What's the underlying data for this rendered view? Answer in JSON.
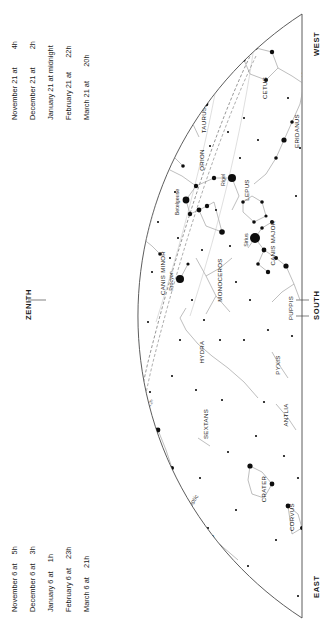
{
  "legend_top": {
    "rows": [
      {
        "date": "November 21 at",
        "time": "4",
        "sup": "h"
      },
      {
        "date": "December 21 at",
        "time": "2",
        "sup": "h"
      },
      {
        "date": "January 21 at midnight",
        "time": "",
        "sup": ""
      },
      {
        "date": "February 21 at",
        "time": "22",
        "sup": "h"
      },
      {
        "date": "March 21 at",
        "time": "20",
        "sup": "h"
      }
    ]
  },
  "legend_bottom": {
    "rows": [
      {
        "date": "November 6 at",
        "time": "5",
        "sup": "h"
      },
      {
        "date": "December 6 at",
        "time": "3",
        "sup": "h"
      },
      {
        "date": "January 6 at",
        "time": "1",
        "sup": "h"
      },
      {
        "date": "February 6 at",
        "time": "23",
        "sup": "h"
      },
      {
        "date": "March 6 at",
        "time": "21",
        "sup": "h"
      }
    ]
  },
  "directions": {
    "west": "WEST",
    "south": "SOUTH",
    "east": "EAST",
    "zenith": "ZENITH"
  },
  "chart_data": {
    "type": "scatter",
    "xlabel": "Right Ascension",
    "ylabel": "Declination",
    "grid": false,
    "legend_position": "left",
    "ecliptic_label": "Ecliptic",
    "constellations": [
      {
        "name": "PERSEUS",
        "x": 131,
        "y": 122
      },
      {
        "name": "TAURUS",
        "x": 206,
        "y": 120
      },
      {
        "name": "CETUS",
        "x": 267,
        "y": 88
      },
      {
        "name": "ERIDANUS",
        "x": 299,
        "y": 131
      },
      {
        "name": "AURIGA",
        "x": 82,
        "y": 189
      },
      {
        "name": "ORION",
        "x": 204,
        "y": 160
      },
      {
        "name": "LEPUS",
        "x": 249,
        "y": 190
      },
      {
        "name": "CANIS MAJOR",
        "x": 275,
        "y": 243
      },
      {
        "name": "GEMINI",
        "x": 104,
        "y": 247
      },
      {
        "name": "CANIS MINOR",
        "x": 165,
        "y": 273
      },
      {
        "name": "MONOCEROS",
        "x": 222,
        "y": 280
      },
      {
        "name": "PUPPIS",
        "x": 293,
        "y": 308
      },
      {
        "name": "LYNX",
        "x": 70,
        "y": 321
      },
      {
        "name": "CANCER",
        "x": 118,
        "y": 355
      },
      {
        "name": "HYDRA",
        "x": 204,
        "y": 352
      },
      {
        "name": "PYXIS",
        "x": 280,
        "y": 365
      },
      {
        "name": "URSA MAJOR",
        "x": 62,
        "y": 392
      },
      {
        "name": "LEO MINOR",
        "x": 106,
        "y": 432
      },
      {
        "name": "LEO",
        "x": 137,
        "y": 434
      },
      {
        "name": "SEXTANS",
        "x": 208,
        "y": 424
      },
      {
        "name": "ANTLIA",
        "x": 288,
        "y": 415
      },
      {
        "name": "CRATER",
        "x": 266,
        "y": 489
      },
      {
        "name": "COMA BERENICES",
        "x": 161,
        "y": 530
      },
      {
        "name": "VIRGO",
        "x": 214,
        "y": 545
      },
      {
        "name": "CORVUS",
        "x": 294,
        "y": 517
      }
    ],
    "stars": [
      {
        "name": "Capella",
        "x": 65,
        "y": 168,
        "mag": 0.1
      },
      {
        "name": "Aldebaran",
        "x": 165,
        "y": 142,
        "mag": 0.9
      },
      {
        "name": "Betelgeuse",
        "x": 186,
        "y": 200,
        "mag": 0.5
      },
      {
        "name": "Rigel",
        "x": 232,
        "y": 178,
        "mag": 0.1
      },
      {
        "name": "Sirius",
        "x": 255,
        "y": 238,
        "mag": -1.5
      },
      {
        "name": "Procyon",
        "x": 180,
        "y": 279,
        "mag": 0.4
      },
      {
        "name": "Castor",
        "x": 97,
        "y": 281,
        "mag": 1.6
      },
      {
        "name": "Pollux",
        "x": 108,
        "y": 289,
        "mag": 1.1
      },
      {
        "name": "Regulus",
        "x": 143,
        "y": 457,
        "mag": 1.4
      },
      {
        "name": "Pleiades",
        "x": 152,
        "y": 107,
        "mag": 1.6
      },
      {
        "name": "Mira",
        "x": 313,
        "y": 70,
        "mag": 3.0
      }
    ],
    "hour_circles": [
      "4ʰ",
      "5ʰ",
      "6ʰ",
      "7ʰ",
      "8ʰ",
      "9ʰ",
      "10ʰ",
      "11ʰ",
      "12ʰ",
      "13ʰ"
    ]
  }
}
